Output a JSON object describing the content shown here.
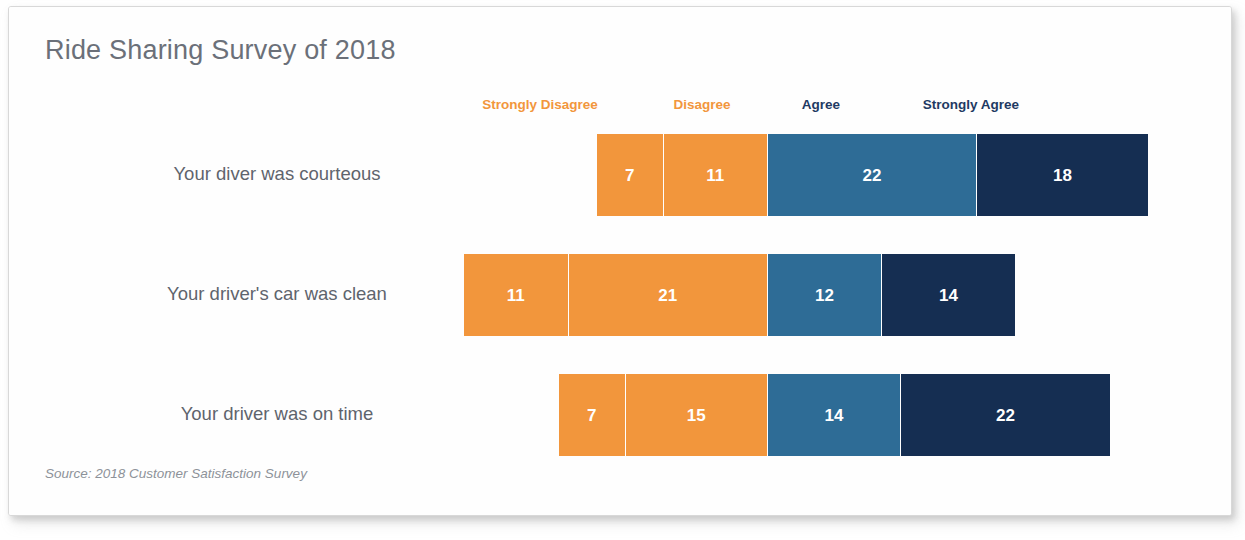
{
  "chart_data": {
    "type": "bar",
    "subtype": "diverging-stacked-bar",
    "title": "Ride Sharing Survey of 2018",
    "source_note": "Source: 2018 Customer Satisfaction Survey",
    "xlabel": "",
    "ylabel": "",
    "grid": false,
    "legend_position": "top",
    "orientation": "horizontal",
    "categories": [
      "Your diver was courteous",
      "Your driver's car was clean",
      "Your driver was on time"
    ],
    "series": [
      {
        "name": "Strongly Disagree",
        "color": "#F2963C",
        "side": "left",
        "values": [
          7,
          11,
          7
        ]
      },
      {
        "name": "Disagree",
        "color": "#F2963C",
        "side": "left",
        "values": [
          11,
          21,
          15
        ]
      },
      {
        "name": "Agree",
        "color": "#2E6C96",
        "side": "right",
        "values": [
          22,
          12,
          14
        ]
      },
      {
        "name": "Strongly Agree",
        "color": "#152E52",
        "side": "right",
        "values": [
          18,
          14,
          22
        ]
      }
    ],
    "rows": [
      {
        "label": "Your diver was courteous",
        "segments": [
          {
            "name": "Strongly Disagree",
            "value": 7,
            "color": "#F2963C"
          },
          {
            "name": "Disagree",
            "value": 11,
            "color": "#F2963C"
          },
          {
            "name": "Agree",
            "value": 22,
            "color": "#2E6C96"
          },
          {
            "name": "Strongly Agree",
            "value": 18,
            "color": "#152E52"
          }
        ],
        "negative_total": 18,
        "positive_total": 40
      },
      {
        "label": "Your driver's car was clean",
        "segments": [
          {
            "name": "Strongly Disagree",
            "value": 11,
            "color": "#F2963C"
          },
          {
            "name": "Disagree",
            "value": 21,
            "color": "#F2963C"
          },
          {
            "name": "Agree",
            "value": 12,
            "color": "#2E6C96"
          },
          {
            "name": "Strongly Agree",
            "value": 14,
            "color": "#152E52"
          }
        ],
        "negative_total": 32,
        "positive_total": 26
      },
      {
        "label": "Your driver was on time",
        "segments": [
          {
            "name": "Strongly Disagree",
            "value": 7,
            "color": "#F2963C"
          },
          {
            "name": "Disagree",
            "value": 15,
            "color": "#F2963C"
          },
          {
            "name": "Agree",
            "value": 14,
            "color": "#2E6C96"
          },
          {
            "name": "Strongly Agree",
            "value": 22,
            "color": "#152E52"
          }
        ],
        "negative_total": 22,
        "positive_total": 36
      }
    ]
  },
  "legend": {
    "items": [
      {
        "label": "Strongly Disagree",
        "color": "#F2963C",
        "center_x": 531
      },
      {
        "label": "Disagree",
        "color": "#F2963C",
        "center_x": 693
      },
      {
        "label": "Agree",
        "color": "#1F3A63",
        "center_x": 812
      },
      {
        "label": "Strongly Agree",
        "color": "#1F3A63",
        "center_x": 962
      }
    ]
  },
  "layout": {
    "center_x": 759,
    "unit_px": 9.5,
    "bar_height": 82,
    "row_tops": [
      127,
      247,
      367
    ],
    "label_right_edge_x": 478
  },
  "colors": {
    "orange": "#F2963C",
    "blue": "#2E6C96",
    "navy": "#152E52",
    "title_gray": "#6B7079",
    "label_gray": "#5F646D",
    "source_gray": "#8D9299",
    "background": "#FFFFFF",
    "frame_border": "#D8D8D8"
  }
}
